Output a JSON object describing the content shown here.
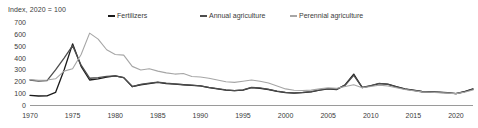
{
  "chart_data": {
    "type": "line",
    "title": "",
    "subtitle": "",
    "ylabel": "Index, 2020 = 100",
    "xlabel": "",
    "ylim": [
      0,
      700
    ],
    "xlim": [
      1970,
      2022
    ],
    "yticks": [
      0,
      100,
      200,
      300,
      400,
      500,
      600,
      700
    ],
    "xticks": [
      1970,
      1975,
      1980,
      1985,
      1990,
      1995,
      2000,
      2005,
      2010,
      2015,
      2020
    ],
    "grid": false,
    "legend_position": "top",
    "x": [
      1970,
      1971,
      1972,
      1973,
      1974,
      1975,
      1976,
      1977,
      1978,
      1979,
      1980,
      1981,
      1982,
      1983,
      1984,
      1985,
      1986,
      1987,
      1988,
      1989,
      1990,
      1991,
      1992,
      1993,
      1994,
      1995,
      1996,
      1997,
      1998,
      1999,
      2000,
      2001,
      2002,
      2003,
      2004,
      2005,
      2006,
      2007,
      2008,
      2009,
      2010,
      2011,
      2012,
      2013,
      2014,
      2015,
      2016,
      2017,
      2018,
      2019,
      2020,
      2021,
      2022
    ],
    "series": [
      {
        "name": "Fertilizers",
        "color": "#1a1a1a",
        "values": [
          85,
          80,
          82,
          110,
          300,
          520,
          330,
          215,
          225,
          240,
          250,
          235,
          160,
          175,
          185,
          195,
          185,
          180,
          175,
          170,
          165,
          150,
          140,
          130,
          125,
          130,
          150,
          145,
          135,
          120,
          108,
          105,
          108,
          115,
          130,
          140,
          135,
          175,
          265,
          150,
          165,
          185,
          180,
          160,
          140,
          130,
          118,
          115,
          112,
          108,
          100,
          118,
          140
        ]
      },
      {
        "name": "Annual agriculture",
        "color": "#4d4d4d",
        "values": [
          215,
          205,
          210,
          300,
          400,
          505,
          340,
          230,
          235,
          245,
          250,
          235,
          160,
          178,
          188,
          198,
          188,
          182,
          176,
          172,
          166,
          152,
          142,
          132,
          126,
          132,
          152,
          148,
          136,
          122,
          110,
          106,
          110,
          117,
          132,
          142,
          136,
          172,
          255,
          152,
          168,
          186,
          178,
          158,
          138,
          128,
          116,
          113,
          110,
          106,
          100,
          116,
          138
        ]
      },
      {
        "name": "Perennial agriculture",
        "color": "#a6a6a6",
        "values": [
          218,
          212,
          215,
          225,
          290,
          310,
          430,
          610,
          560,
          470,
          430,
          425,
          330,
          300,
          310,
          290,
          275,
          265,
          270,
          245,
          240,
          230,
          215,
          200,
          195,
          205,
          215,
          205,
          190,
          165,
          140,
          128,
          126,
          130,
          140,
          150,
          145,
          160,
          175,
          150,
          160,
          172,
          165,
          150,
          135,
          125,
          115,
          112,
          108,
          104,
          100,
          112,
          130
        ]
      }
    ]
  }
}
